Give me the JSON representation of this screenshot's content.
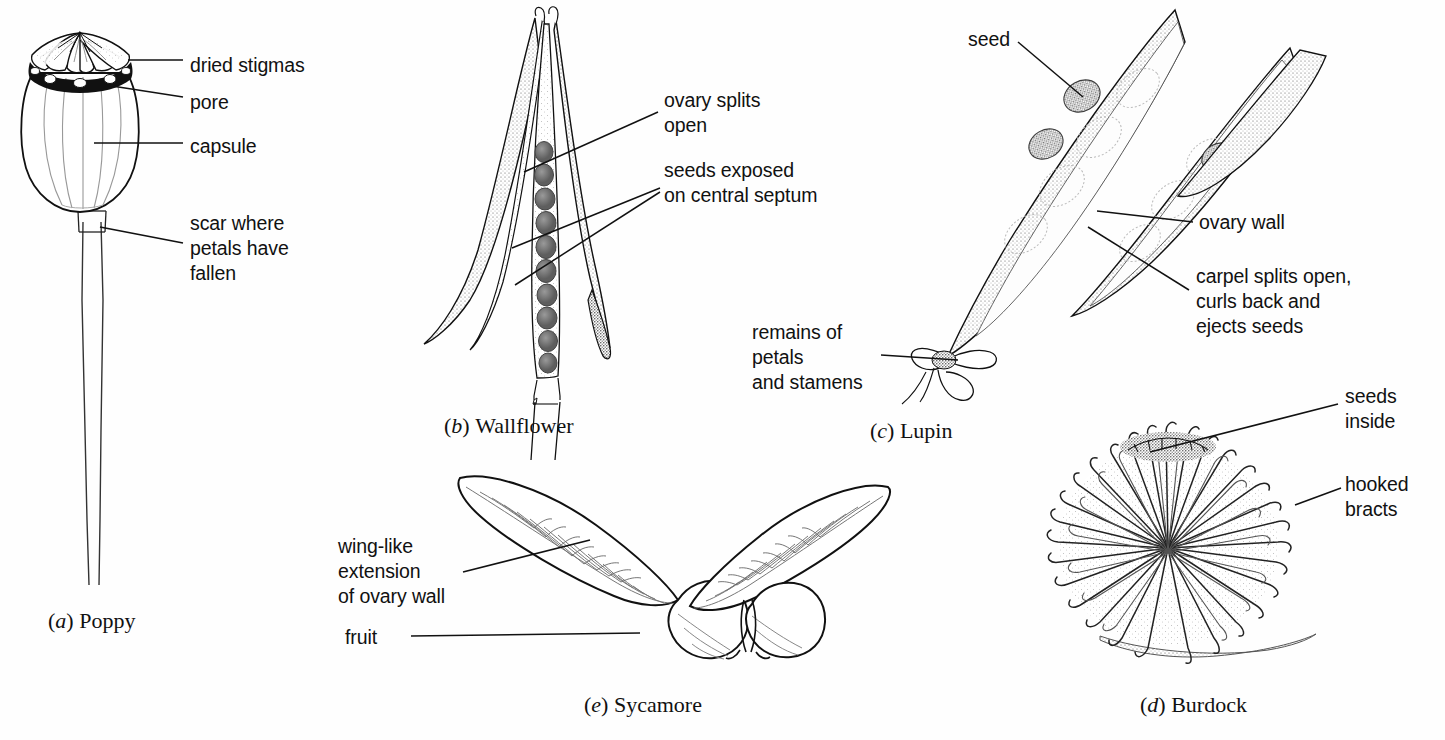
{
  "figure": {
    "kind": "botanical-line-drawing",
    "title_visible": false,
    "background_color": "#ffffff",
    "ink_color": "#111111",
    "panels": [
      {
        "id": "a",
        "caption_letter": "a",
        "caption_name": "Poppy",
        "caption": "(a) Poppy",
        "labels": [
          {
            "id": "dried-stigmas",
            "text": "dried stigmas",
            "lines": [
              "dried stigmas"
            ]
          },
          {
            "id": "pore",
            "text": "pore",
            "lines": [
              "pore"
            ]
          },
          {
            "id": "capsule",
            "text": "capsule",
            "lines": [
              "capsule"
            ]
          },
          {
            "id": "scar",
            "text": "scar where petals have fallen",
            "lines": [
              "scar where",
              "petals have",
              "fallen"
            ]
          }
        ]
      },
      {
        "id": "b",
        "caption_letter": "b",
        "caption_name": "Wallflower",
        "caption": "(b) Wallflower",
        "labels": [
          {
            "id": "ovary-splits-open",
            "text": "ovary splits open",
            "lines": [
              "ovary splits",
              "open"
            ]
          },
          {
            "id": "seeds-exposed",
            "text": "seeds exposed on central septum",
            "lines": [
              "seeds exposed",
              "on central septum"
            ]
          }
        ]
      },
      {
        "id": "c",
        "caption_letter": "c",
        "caption_name": "Lupin",
        "caption": "(c) Lupin",
        "labels": [
          {
            "id": "seed",
            "text": "seed",
            "lines": [
              "seed"
            ]
          },
          {
            "id": "ovary-wall",
            "text": "ovary wall",
            "lines": [
              "ovary wall"
            ]
          },
          {
            "id": "carpel-splits",
            "text": "carpel splits open, curls back and ejects seeds",
            "lines": [
              "carpel splits open,",
              "curls back and",
              "ejects seeds"
            ]
          },
          {
            "id": "remains-of-petals",
            "text": "remains of petals and stamens",
            "lines": [
              "remains of",
              "petals",
              "and stamens"
            ]
          }
        ]
      },
      {
        "id": "d",
        "caption_letter": "d",
        "caption_name": "Burdock",
        "caption": "(d) Burdock",
        "labels": [
          {
            "id": "seeds-inside",
            "text": "seeds inside",
            "lines": [
              "seeds",
              "inside"
            ]
          },
          {
            "id": "hooked-bracts",
            "text": "hooked bracts",
            "lines": [
              "hooked",
              "bracts"
            ]
          }
        ]
      },
      {
        "id": "e",
        "caption_letter": "e",
        "caption_name": "Sycamore",
        "caption": "(e) Sycamore",
        "labels": [
          {
            "id": "wing-like-extension",
            "text": "wing-like extension of ovary wall",
            "lines": [
              "wing-like",
              "extension",
              "of ovary wall"
            ]
          },
          {
            "id": "fruit",
            "text": "fruit",
            "lines": [
              "fruit"
            ]
          }
        ]
      }
    ]
  },
  "poppy": {
    "labels": {
      "dried_stigmas": "dried stigmas",
      "pore": "pore",
      "capsule": "capsule",
      "scar_1": "scar where",
      "scar_2": "petals have",
      "scar_3": "fallen"
    },
    "caption_paren_open": "(",
    "caption_letter": "a",
    "caption_paren_close": ") ",
    "caption_name": "Poppy"
  },
  "wallflower": {
    "labels": {
      "ovary_1": "ovary splits",
      "ovary_2": "open",
      "seeds_1": "seeds exposed",
      "seeds_2": "on central septum"
    },
    "caption_letter": "b",
    "caption_name": "Wallflower"
  },
  "lupin": {
    "labels": {
      "seed": "seed",
      "ovary_wall": "ovary wall",
      "carpel_1": "carpel splits open,",
      "carpel_2": "curls back and",
      "carpel_3": "ejects seeds",
      "remains_1": "remains of",
      "remains_2": "petals",
      "remains_3": "and stamens"
    },
    "caption_letter": "c",
    "caption_name": "Lupin"
  },
  "burdock": {
    "labels": {
      "seeds_1": "seeds",
      "seeds_2": "inside",
      "bracts_1": "hooked",
      "bracts_2": "bracts"
    },
    "caption_letter": "d",
    "caption_name": "Burdock"
  },
  "sycamore": {
    "labels": {
      "wing_1": "wing-like",
      "wing_2": "extension",
      "wing_3": "of ovary wall",
      "fruit": "fruit"
    },
    "caption_letter": "e",
    "caption_name": "Sycamore"
  }
}
